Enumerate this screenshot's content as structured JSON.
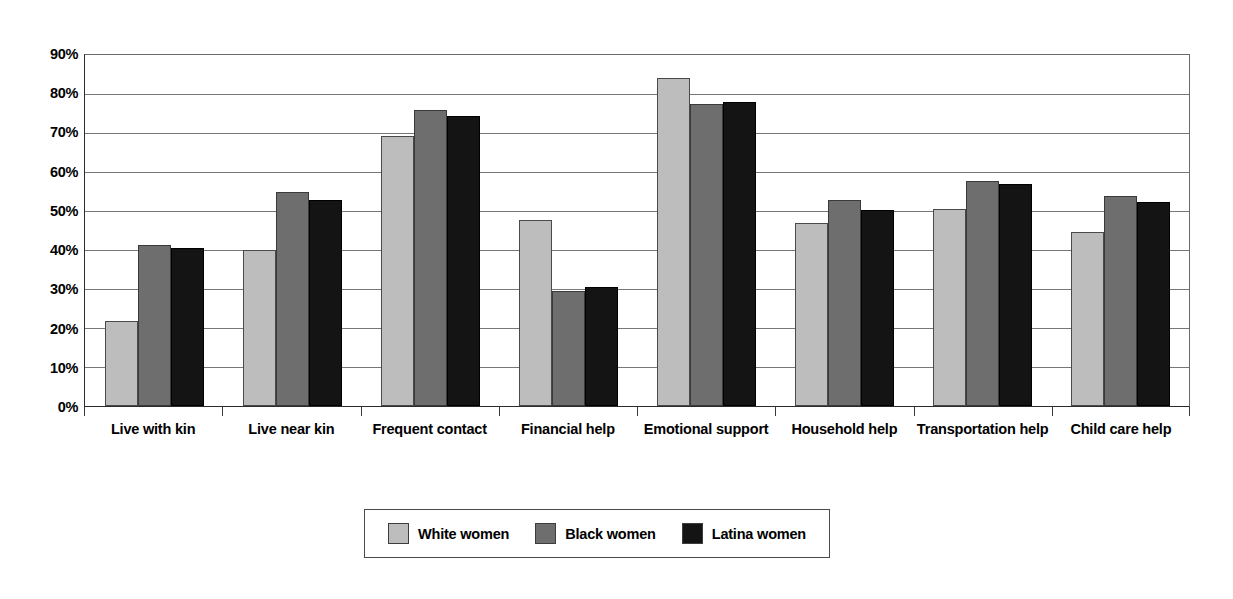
{
  "chart_data": {
    "type": "bar",
    "title": "",
    "subtitle": "",
    "xlabel": "",
    "ylabel": "",
    "ylim": [
      0,
      90
    ],
    "y_tick_labels": [
      "90%",
      "80%",
      "70%",
      "60%",
      "50%",
      "40%",
      "30%",
      "20%",
      "10%",
      "0%"
    ],
    "y_tick_values": [
      90,
      80,
      70,
      60,
      50,
      40,
      30,
      20,
      10,
      0
    ],
    "grid": true,
    "legend_position": "bottom",
    "categories": [
      "Live with kin",
      "Live near kin",
      "Frequent contact",
      "Financial help",
      "Emotional support",
      "Household help",
      "Transportation help",
      "Child care help"
    ],
    "series": [
      {
        "name": "White women",
        "color": "#bdbdbd",
        "values": [
          21.8,
          40.0,
          69.2,
          47.8,
          84.2,
          46.8,
          50.6,
          44.5
        ]
      },
      {
        "name": "Black women",
        "color": "#6e6e6e",
        "values": [
          41.4,
          55.0,
          76.0,
          29.6,
          77.4,
          52.8,
          57.8,
          53.9
        ]
      },
      {
        "name": "Latina women",
        "color": "#141414",
        "values": [
          40.5,
          52.8,
          74.4,
          30.5,
          78.0,
          50.3,
          56.8,
          52.4
        ]
      }
    ]
  },
  "legend": {
    "items": [
      {
        "label": "White women",
        "swatch": "legend-swatch-white-women"
      },
      {
        "label": "Black women",
        "swatch": "legend-swatch-black-women"
      },
      {
        "label": "Latina women",
        "swatch": "legend-swatch-latina-women"
      }
    ]
  }
}
